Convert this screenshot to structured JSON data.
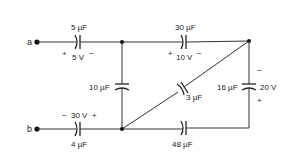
{
  "diagram": {
    "type": "capacitor-circuit",
    "terminals": {
      "a": {
        "label": "a"
      },
      "b": {
        "label": "b"
      }
    },
    "capacitors": {
      "c_top_left": {
        "capacitance": "5 µF",
        "voltage": "5 V",
        "plus": "+",
        "minus": "−"
      },
      "c_top_right": {
        "capacitance": "30 µF",
        "voltage": "10 V",
        "plus": "+",
        "minus": "−"
      },
      "c_middle_vertical": {
        "capacitance": "10 µF"
      },
      "c_diagonal": {
        "capacitance": "3 µF"
      },
      "c_right_vertical": {
        "capacitance": "16 µF",
        "voltage": "20 V",
        "plus": "+",
        "minus": "−"
      },
      "c_bottom_left": {
        "capacitance": "4 µF",
        "voltage": "30 V",
        "plus": "+",
        "minus": "−"
      },
      "c_bottom_right": {
        "capacitance": "48 µF"
      }
    },
    "colors": {
      "wire": "#333333",
      "background": "#ffffff"
    }
  }
}
